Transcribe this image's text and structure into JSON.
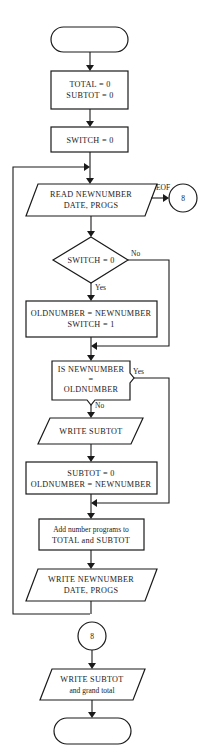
{
  "diagram": {
    "type": "flowchart",
    "start_terminal": {
      "label": ""
    },
    "steps": {
      "init_totals": {
        "line1": "TOTAL = 0",
        "line2": "SUBTOT = 0"
      },
      "init_switch": {
        "line1": "SWITCH = 0"
      },
      "read_input": {
        "line1": "READ NEWNUMBER",
        "line2": "DATE, PROGS",
        "eof_label": "EOF"
      },
      "eof_connector": {
        "label": "8"
      },
      "switch_decision": {
        "line1": "SWITCH = 0",
        "no_label": "No",
        "yes_label": "Yes"
      },
      "set_old": {
        "line1": "OLDNUMBER = NEWNUMBER",
        "line2": "SWITCH = 1"
      },
      "compare_decision": {
        "line1": "IS NEWNUMBER",
        "line2": "=",
        "line3": "OLDNUMBER",
        "yes_label": "Yes",
        "no_label": "No"
      },
      "write_subtot": {
        "line1": "WRITE SUBTOT"
      },
      "reset_subtot": {
        "line1": "SUBTOT = 0",
        "line2": "OLDNUMBER = NEWNUMBER"
      },
      "add_programs": {
        "line1": "Add number programs to",
        "line2": "TOTAL and SUBTOT"
      },
      "write_record": {
        "line1": "WRITE NEWNUMBER",
        "line2": "DATE, PROGS"
      },
      "connector_entry": {
        "label": "8"
      },
      "write_final": {
        "line1": "WRITE SUBTOT",
        "line2": "and grand total"
      }
    },
    "end_terminal": {
      "label": ""
    }
  }
}
